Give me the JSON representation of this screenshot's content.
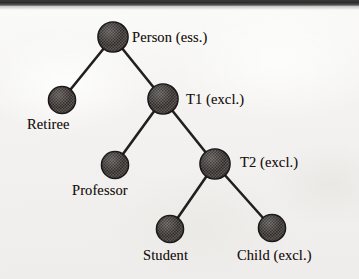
{
  "diagram": {
    "type": "taxonomy-tree",
    "background_color": "#f2f1ef",
    "node_fill_color": "#4f4a47",
    "node_stroke_color": "#141212",
    "edge_color": "#231f1e",
    "text_color": "#18100e",
    "nodes": [
      {
        "id": "person",
        "label": "Person  (ess.)",
        "cx": 113,
        "cy": 37,
        "r": 15,
        "label_x": 132,
        "label_y": 30,
        "label_align": "right-of-node"
      },
      {
        "id": "retiree",
        "label": "Retiree",
        "cx": 62,
        "cy": 100,
        "r": 13.5,
        "label_x": 27,
        "label_y": 117,
        "label_align": "below-node"
      },
      {
        "id": "t1",
        "label": "T1  (excl.)",
        "cx": 163,
        "cy": 99,
        "r": 15,
        "label_x": 186,
        "label_y": 92,
        "label_align": "right-of-node"
      },
      {
        "id": "professor",
        "label": "Professor",
        "cx": 115,
        "cy": 165,
        "r": 13.5,
        "label_x": 72,
        "label_y": 183,
        "label_align": "below-node"
      },
      {
        "id": "t2",
        "label": "T2  (excl.)",
        "cx": 215,
        "cy": 164,
        "r": 15,
        "label_x": 240,
        "label_y": 155,
        "label_align": "right-of-node"
      },
      {
        "id": "student",
        "label": "Student",
        "cx": 170,
        "cy": 229,
        "r": 13.5,
        "label_x": 143,
        "label_y": 248,
        "label_align": "below-node"
      },
      {
        "id": "child",
        "label": "Child  (excl.)",
        "cx": 272,
        "cy": 228,
        "r": 13.5,
        "label_x": 237,
        "label_y": 248,
        "label_align": "below-node"
      }
    ],
    "edges": [
      {
        "from": "person",
        "to": "retiree"
      },
      {
        "from": "person",
        "to": "t1"
      },
      {
        "from": "t1",
        "to": "professor"
      },
      {
        "from": "t1",
        "to": "t2"
      },
      {
        "from": "t2",
        "to": "student"
      },
      {
        "from": "t2",
        "to": "child"
      }
    ]
  }
}
